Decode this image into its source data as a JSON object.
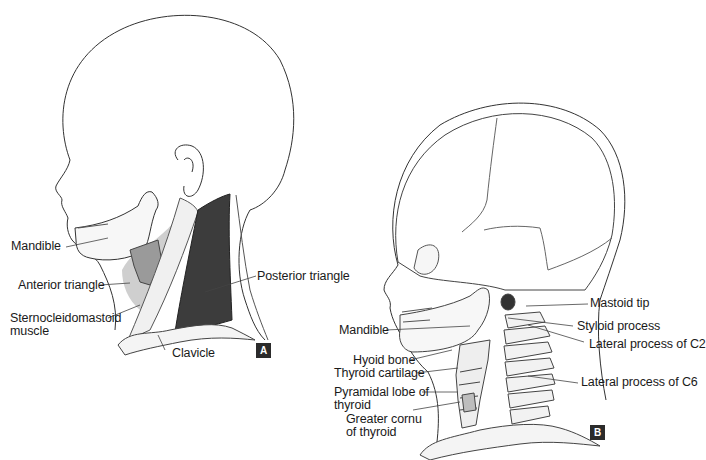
{
  "figure": {
    "panels": [
      {
        "id": "A",
        "badge": "A",
        "labels": {
          "mandible": "Mandible",
          "anterior_triangle": "Anterior triangle",
          "scm_line1": "Sternocleidomastoid",
          "scm_line2": "muscle",
          "posterior_triangle": "Posterior triangle",
          "clavicle": "Clavicle"
        }
      },
      {
        "id": "B",
        "badge": "B",
        "labels": {
          "mandible": "Mandible",
          "hyoid_bone": "Hyoid bone",
          "thyroid_cartilage": "Thyroid cartilage",
          "pyramidal_line1": "Pyramidal lobe of",
          "pyramidal_line2": "thyroid",
          "cornu_line1": "Greater cornu",
          "cornu_line2": "of thyroid",
          "mastoid_tip": "Mastoid tip",
          "styloid_process": "Styloid process",
          "lateral_c2": "Lateral process of C2",
          "lateral_c6": "Lateral process of C6"
        }
      }
    ]
  }
}
